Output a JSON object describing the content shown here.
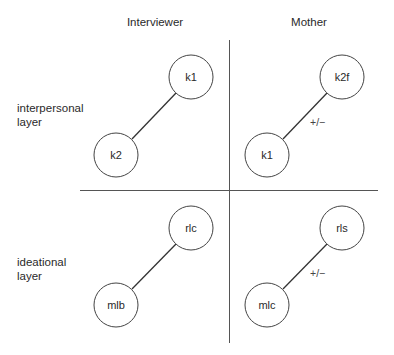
{
  "columns": [
    {
      "label": "Interviewer"
    },
    {
      "label": "Mother"
    }
  ],
  "rows": [
    {
      "label_line1": "interpersonal",
      "label_line2": "layer"
    },
    {
      "label_line1": "ideational",
      "label_line2": "layer"
    }
  ],
  "quadrants": {
    "interviewer_interpersonal": {
      "top_node": "k1",
      "bottom_node": "k2",
      "edge_label": ""
    },
    "mother_interpersonal": {
      "top_node": "k2f",
      "bottom_node": "k1",
      "edge_label": "+/−"
    },
    "interviewer_ideational": {
      "top_node": "rlc",
      "bottom_node": "mlb",
      "edge_label": ""
    },
    "mother_ideational": {
      "top_node": "rls",
      "bottom_node": "mlc",
      "edge_label": "+/−"
    }
  },
  "colors": {
    "line": "#333333",
    "divider": "#555555",
    "background": "#ffffff"
  }
}
